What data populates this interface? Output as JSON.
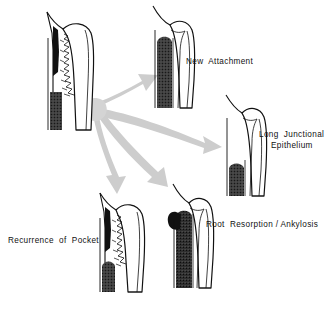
{
  "figure": {
    "background_color": "#ffffff",
    "ink_color": "#111111",
    "arrow_color": "#cccccc",
    "bone_fill_color": "#3a3a3a",
    "pocket_fill_color": "#111111",
    "width": 330,
    "height": 310
  },
  "source_panel": {
    "name": "Initial periodontal defect with pocket",
    "label": ""
  },
  "outcomes": [
    {
      "id": "new-attachment",
      "label": "New  Attachment",
      "arrow": "up-right"
    },
    {
      "id": "long-junctional-epithelium",
      "label_line_1": "Long  Junctional",
      "label_line_2": "Epithelium",
      "arrow": "right"
    },
    {
      "id": "recurrence-of-pocket",
      "label": "Recurrence  of  Pocket",
      "arrow": "down"
    },
    {
      "id": "root-resorption-ankylosis",
      "label": "Root  Resorption / Ankylosis",
      "arrow": "down-right"
    }
  ]
}
